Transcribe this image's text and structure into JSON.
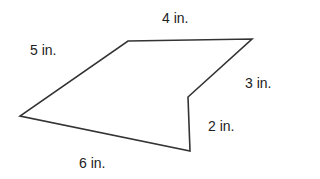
{
  "diagram": {
    "shape": "pentagon",
    "stroke_color": "#333333",
    "vertices": [
      [
        128,
        41
      ],
      [
        252,
        39
      ],
      [
        188,
        97
      ],
      [
        190,
        151
      ],
      [
        20,
        116
      ]
    ],
    "sides": [
      {
        "id": "top",
        "label": "4 in."
      },
      {
        "id": "upper-right",
        "label": "3 in."
      },
      {
        "id": "lower-right",
        "label": "2 in."
      },
      {
        "id": "bottom",
        "label": "6 in."
      },
      {
        "id": "upper-left",
        "label": "5 in."
      }
    ]
  }
}
